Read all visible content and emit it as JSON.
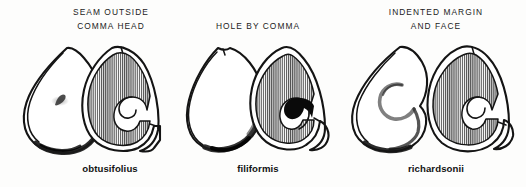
{
  "plate": {
    "title": "Potamogeton seed identification plate",
    "background_color": "#fdfdfc",
    "ink_color": "#141414",
    "hatch_color": "#5d5d5d"
  },
  "columns": [
    {
      "id": "obtusifolius",
      "header_lines": [
        "SEAM  OUTSIDE",
        "COMMA  HEAD"
      ],
      "species": "obtusifolius",
      "views": [
        {
          "type": "exterior",
          "name": "exterior-view",
          "features": [
            "pointed apex",
            "seam ridge along left margin",
            "small comma scar at centre",
            "dark shading along lower right margin"
          ]
        },
        {
          "type": "cross-section",
          "name": "cross-section-view",
          "features": [
            "fine vertical hatching",
            "white comma-shaped embryo channel",
            "notch at apex",
            "angular lower right margin"
          ]
        }
      ]
    },
    {
      "id": "filiformis",
      "header_lines": [
        "HOLE  BY  COMMA"
      ],
      "species": "filiformis",
      "views": [
        {
          "type": "exterior",
          "name": "exterior-view",
          "features": [
            "smooth ovoid outline",
            "notched apex",
            "heavy shading on right and lower margin",
            "seam line on left"
          ]
        },
        {
          "type": "cross-section",
          "name": "cross-section-view",
          "features": [
            "fine vertical hatching",
            "solid black hole beside comma",
            "white comma-shaped embryo channel",
            "rounded outline"
          ]
        }
      ]
    },
    {
      "id": "richardsonii",
      "header_lines": [
        "INDENTED  MARGIN",
        "AND  FACE"
      ],
      "species": "richardsonii",
      "views": [
        {
          "type": "exterior",
          "name": "exterior-view",
          "features": [
            "prominent curved comma impressed on face",
            "indentation in lower right margin",
            "seam ridge along left",
            "dark shading at base"
          ]
        },
        {
          "type": "cross-section",
          "name": "cross-section-view",
          "features": [
            "fine vertical hatching",
            "broad rounded outline",
            "white comma-shaped embryo channel",
            "indented right margin"
          ]
        }
      ]
    }
  ]
}
